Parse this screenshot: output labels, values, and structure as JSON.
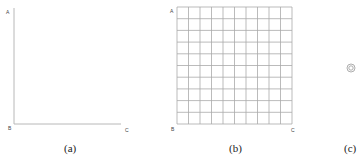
{
  "panels": [
    {
      "id": "a",
      "caption": "(a)",
      "labels": {
        "top": "A",
        "origin": "B",
        "right": "C"
      },
      "type": "empty-axes"
    },
    {
      "id": "b",
      "caption": "(b)",
      "labels": {
        "top": "A",
        "origin": "B",
        "right": "C"
      },
      "type": "grid",
      "rows": 10,
      "cols": 10
    },
    {
      "id": "c",
      "caption": "(c)",
      "type": "concentric-circles"
    }
  ],
  "colors": {
    "axis": "#b8b8b8",
    "grid": "#aaaaaa",
    "text": "#333333"
  }
}
